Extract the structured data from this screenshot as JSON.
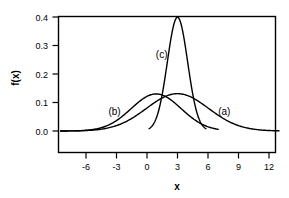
{
  "chart_data": {
    "type": "line",
    "title": "",
    "subtitle": "",
    "xlabel": "x",
    "ylabel": "f(x)",
    "xlim": [
      -8.6,
      13.0
    ],
    "ylim": [
      0.0,
      0.44
    ],
    "xticks": [
      -6,
      -3,
      0,
      3,
      6,
      9,
      12
    ],
    "xtick_labels": [
      "-6",
      "-3",
      "0",
      "3",
      "6",
      "9",
      "12"
    ],
    "yticks": [
      0.0,
      0.1,
      0.2,
      0.3,
      0.4
    ],
    "ytick_labels": [
      "0.0",
      "0.1",
      "0.2",
      "0.3",
      "0.4"
    ],
    "grid": false,
    "legend_position": "inline-annotations",
    "frame": "box",
    "line_color": "#000000",
    "background_color": "#ffffff",
    "annotations": [
      {
        "text": "(a)",
        "x": 7.6,
        "y": 0.055
      },
      {
        "text": "(b)",
        "x": -3.2,
        "y": 0.058
      },
      {
        "text": "(c)",
        "x": 1.45,
        "y": 0.255
      }
    ],
    "series": [
      {
        "name": "(a)",
        "label": "(a)",
        "distribution": "normal",
        "mean": 3.0,
        "sigma": 3.05,
        "peak": 0.131,
        "x": [
          -8.5,
          -7.5,
          -6.0,
          -4.5,
          -3.0,
          -1.5,
          0.0,
          1.5,
          3.0,
          4.5,
          6.0,
          7.5,
          9.0,
          10.5,
          12.0,
          13.0
        ],
        "y": [
          0.0005,
          0.001,
          0.003,
          0.011,
          0.025,
          0.052,
          0.087,
          0.118,
          0.131,
          0.118,
          0.087,
          0.052,
          0.025,
          0.011,
          0.003,
          0.001
        ]
      },
      {
        "name": "(b)",
        "label": "(b)",
        "distribution": "normal",
        "mean": 0.9,
        "sigma": 2.45,
        "peak": 0.13,
        "x": [
          -8.5,
          -7.5,
          -6.0,
          -4.5,
          -3.0,
          -1.5,
          0.0,
          0.9,
          1.8,
          3.0,
          4.5,
          6.0,
          7.0
        ],
        "y": [
          0.0006,
          0.002,
          0.006,
          0.019,
          0.048,
          0.091,
          0.125,
          0.13,
          0.125,
          0.091,
          0.048,
          0.019,
          0.008
        ]
      },
      {
        "name": "(c)",
        "label": "(c)",
        "distribution": "normal",
        "mean": 3.0,
        "sigma": 1.0,
        "peak": 0.399,
        "x": [
          0.2,
          0.5,
          1.0,
          1.5,
          2.0,
          2.5,
          3.0,
          3.5,
          4.0,
          4.5,
          5.0,
          5.5,
          5.8
        ],
        "y": [
          0.008,
          0.018,
          0.054,
          0.13,
          0.242,
          0.352,
          0.399,
          0.352,
          0.242,
          0.13,
          0.054,
          0.018,
          0.008
        ]
      }
    ]
  }
}
